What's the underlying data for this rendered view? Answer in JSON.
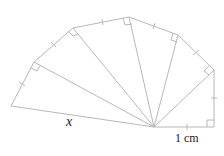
{
  "diagram": {
    "type": "spiral-of-theodorus",
    "center": [
      154,
      127
    ],
    "outer_vertices": [
      [
        214,
        127
      ],
      [
        214,
        70
      ],
      [
        178,
        35
      ],
      [
        129,
        17
      ],
      [
        73,
        28
      ],
      [
        34,
        62
      ],
      [
        11,
        106
      ]
    ],
    "labels": {
      "hypotenuse": "x",
      "unit": "1 cm"
    },
    "line_color": "#b8b8b8"
  }
}
